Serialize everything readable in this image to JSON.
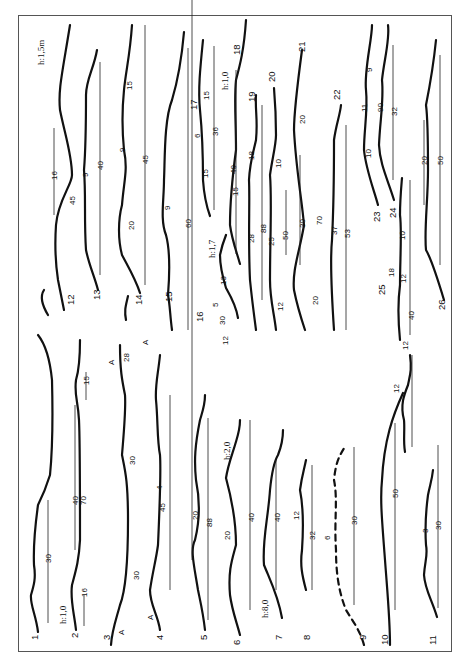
{
  "figure": {
    "orientation": "rotated-90-ccw",
    "profiles": [
      {
        "id": "1",
        "label": "1"
      },
      {
        "id": "2",
        "label": "2"
      },
      {
        "id": "3",
        "label": "3"
      },
      {
        "id": "4",
        "label": "4"
      },
      {
        "id": "5",
        "label": "5"
      },
      {
        "id": "6",
        "label": "6"
      },
      {
        "id": "7",
        "label": "7"
      },
      {
        "id": "8",
        "label": "8"
      },
      {
        "id": "9",
        "label": "9"
      },
      {
        "id": "10",
        "label": "10"
      },
      {
        "id": "11",
        "label": "11"
      },
      {
        "id": "12",
        "label": "12"
      },
      {
        "id": "13",
        "label": "13"
      },
      {
        "id": "14",
        "label": "14"
      },
      {
        "id": "15",
        "label": "15"
      },
      {
        "id": "16",
        "label": "16"
      },
      {
        "id": "17",
        "label": "17"
      },
      {
        "id": "18",
        "label": "18"
      },
      {
        "id": "19",
        "label": "19"
      },
      {
        "id": "20",
        "label": "20"
      },
      {
        "id": "21",
        "label": "21"
      },
      {
        "id": "22",
        "label": "22"
      },
      {
        "id": "23",
        "label": "23"
      },
      {
        "id": "24",
        "label": "24"
      },
      {
        "id": "25",
        "label": "25"
      },
      {
        "id": "26",
        "label": "26"
      }
    ],
    "height_scales": {
      "h15": "h:1,5m",
      "h10a": "h:1,0",
      "h10b": "h:1,0",
      "h17": "h:1,7",
      "h20": "h:2,0",
      "h80": "h:8,0"
    },
    "marker_A": "A",
    "measurements": {
      "p1": [
        "30"
      ],
      "p2": [
        "16",
        "40",
        "70",
        "15"
      ],
      "p3": [
        "30",
        "30",
        "28"
      ],
      "p4": [
        "45",
        "4"
      ],
      "p5": [
        "20",
        "88"
      ],
      "p6": [
        "20",
        "40"
      ],
      "p7": [
        "40"
      ],
      "p8": [
        "12",
        "32"
      ],
      "p9": [
        "6",
        "30"
      ],
      "p10": [
        "50"
      ],
      "p11": [
        "3",
        "30"
      ],
      "p10b": [
        "12",
        "12"
      ],
      "p12": [
        "16",
        "45"
      ],
      "p13": [
        "9",
        "40"
      ],
      "p14": [
        "15",
        "9",
        "45",
        "20"
      ],
      "p15": [
        "9",
        "60"
      ],
      "p16": [
        "13",
        "30",
        "5",
        "12"
      ],
      "p17": [
        "6",
        "15",
        "36",
        "15"
      ],
      "p18": [
        "40"
      ],
      "p19": [
        "18",
        "28",
        "15"
      ],
      "p20": [
        "10",
        "25",
        "50",
        "12",
        "88"
      ],
      "p21": [
        "20",
        "30",
        "70",
        "20"
      ],
      "p22": [
        "37",
        "53"
      ],
      "p23": [
        "11",
        "10",
        "9"
      ],
      "p24": [
        "90",
        "32"
      ],
      "p25": [
        "18",
        "10",
        "40",
        "12"
      ],
      "p26": [
        "20",
        "50"
      ]
    }
  }
}
